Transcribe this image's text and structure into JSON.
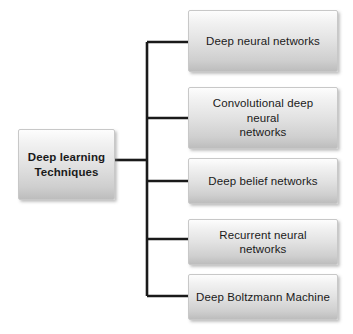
{
  "diagram": {
    "type": "hierarchy-tree",
    "orientation": "left-to-right",
    "colors": {
      "box_fill_top": "#fdfdfd",
      "box_fill_bottom": "#bdbdbd",
      "box_border": "#c8c8c8",
      "connector": "#1a1a1a",
      "text": "#1a1a1a",
      "background": "#ffffff"
    },
    "root": {
      "label": "Deep learning Techniques",
      "line1": "Deep learning",
      "line2": "Techniques",
      "x": 18,
      "y": 129,
      "width": 97,
      "height": 71
    },
    "children": [
      {
        "label": "Deep neural networks",
        "line1": "Deep neural networks",
        "line2": "",
        "x": 188,
        "y": 10,
        "width": 150,
        "height": 62,
        "branch_y": 42
      },
      {
        "label": "Convolutional deep neural networks",
        "line1": "Convolutional deep neural",
        "line2": "networks",
        "x": 188,
        "y": 87,
        "width": 150,
        "height": 62,
        "branch_y": 118
      },
      {
        "label": "Deep belief networks",
        "line1": "Deep belief networks",
        "line2": "",
        "x": 188,
        "y": 158,
        "width": 150,
        "height": 46,
        "branch_y": 181
      },
      {
        "label": "Recurrent neural networks",
        "line1": "Recurrent neural networks",
        "line2": "",
        "x": 188,
        "y": 219,
        "width": 150,
        "height": 46,
        "branch_y": 239
      },
      {
        "label": "Deep Boltzmann Machine",
        "line1": "Deep Boltzmann Machine",
        "line2": "",
        "x": 188,
        "y": 274,
        "width": 150,
        "height": 46,
        "branch_y": 296
      }
    ],
    "connectors": {
      "trunk_x": 147,
      "trunk_top": 42,
      "trunk_bottom": 296,
      "stem_y": 160,
      "stem_start_x": 115,
      "branch_end_x": 188,
      "stroke_width": 2.6
    }
  }
}
